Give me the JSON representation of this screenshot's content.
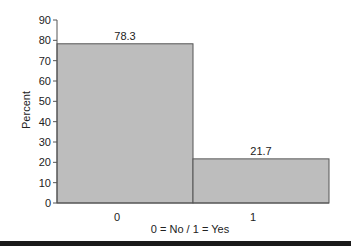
{
  "chart_data": {
    "type": "bar",
    "title": "",
    "xlabel": "0 = No / 1 = Yes",
    "ylabel": "Percent",
    "categories": [
      "0",
      "1"
    ],
    "values": [
      78.3,
      21.7
    ],
    "data_labels": [
      "78.3",
      "21.7"
    ],
    "ylim": [
      0,
      90
    ],
    "yticks": [
      0,
      10,
      20,
      30,
      40,
      50,
      60,
      70,
      80,
      90
    ],
    "grid": false,
    "legend": null,
    "bar_color": "#bdbdbd",
    "bar_edge_color": "#555555"
  }
}
